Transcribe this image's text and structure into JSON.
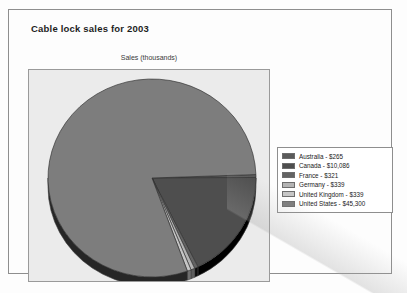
{
  "chart": {
    "title": "Cable lock sales for 2003",
    "subtitle": "Sales (thousands)"
  },
  "legend": {
    "items": [
      {
        "label": "Australia - $265",
        "color": "#5a5a5a"
      },
      {
        "label": "Canada - $10,086",
        "color": "#4e4e4e"
      },
      {
        "label": "France - $321",
        "color": "#636363"
      },
      {
        "label": "Germany - $339",
        "color": "#b4b4b4"
      },
      {
        "label": "United Kingdom - $339",
        "color": "#c6c6c6"
      },
      {
        "label": "United States - $45,300",
        "color": "#7d7d7d"
      }
    ]
  },
  "chart_data": {
    "type": "pie",
    "title": "Cable lock sales for 2003",
    "subtitle": "Sales (thousands)",
    "xlabel": "",
    "ylabel": "Sales (thousands)",
    "legend_position": "right",
    "grid": false,
    "categories": [
      "Australia",
      "Canada",
      "France",
      "Germany",
      "United Kingdom",
      "United States"
    ],
    "values": [
      265,
      10086,
      321,
      339,
      339,
      45300
    ],
    "value_labels": [
      "$265",
      "$10,086",
      "$321",
      "$339",
      "$339",
      "$45,300"
    ],
    "percentages": [
      0.47,
      17.72,
      0.56,
      0.6,
      0.6,
      79.6
    ],
    "colors": [
      "#5a5a5a",
      "#4e4e4e",
      "#636363",
      "#b4b4b4",
      "#c6c6c6",
      "#7d7d7d"
    ],
    "total": 56650
  }
}
